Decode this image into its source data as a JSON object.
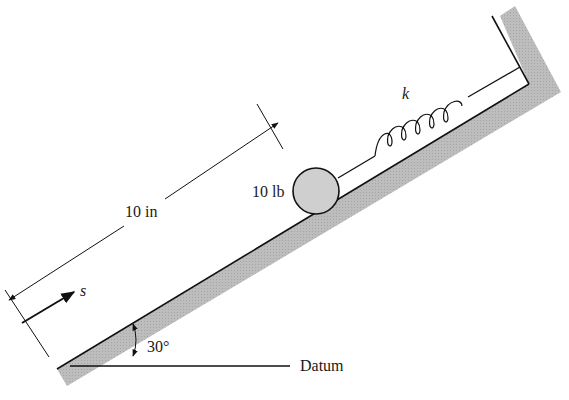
{
  "figure": {
    "labels": {
      "distance": "10 in",
      "weight": "10 lb",
      "spring_constant": "k",
      "displacement": "s",
      "angle": "30°",
      "datum": "Datum"
    },
    "colors": {
      "line": "#111111",
      "ground_fill": "#b8b8b8",
      "ball_fill": "#cfcfcf",
      "background": "#ffffff"
    }
  }
}
